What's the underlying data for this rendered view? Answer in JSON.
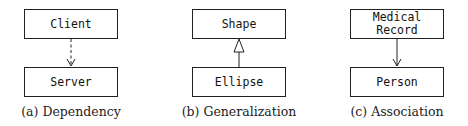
{
  "panels": [
    {
      "id": "a",
      "top_box": "Client",
      "bottom_box": "Server",
      "relation": "dependency",
      "connector": {
        "line": "dashed",
        "arrowhead": "open-arrow",
        "direction": "top-to-bottom"
      },
      "caption": "(a) Dependency"
    },
    {
      "id": "b",
      "top_box": "Shape",
      "bottom_box": "Ellipse",
      "relation": "generalization",
      "connector": {
        "line": "solid",
        "arrowhead": "hollow-triangle",
        "direction": "bottom-to-top"
      },
      "caption": "(b) Generalization"
    },
    {
      "id": "c",
      "top_box_lines": [
        "Medical",
        "Record"
      ],
      "bottom_box": "Person",
      "relation": "association",
      "connector": {
        "line": "solid",
        "arrowhead": "open-arrow",
        "direction": "top-to-bottom"
      },
      "caption": "(c) Association"
    }
  ]
}
